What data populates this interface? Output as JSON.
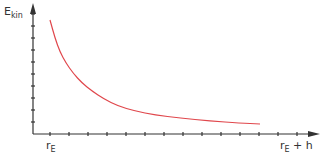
{
  "chart_data": {
    "type": "line",
    "title": "",
    "ylabel": "E_kin",
    "ylabel_main": "E",
    "ylabel_sub": "kin",
    "xlabel": "",
    "x_tick_labels": [
      {
        "main": "r",
        "sub": "E",
        "suffix": "",
        "position": "start"
      },
      {
        "main": "r",
        "sub": "E",
        "suffix": " + h",
        "position": "end"
      }
    ],
    "series": [
      {
        "name": "E_kin(r)",
        "color": "#e0474c",
        "shape": "hyperbolic decay (~1/r)",
        "points_px": [
          [
            50,
            20
          ],
          [
            55,
            38
          ],
          [
            60,
            52
          ],
          [
            66,
            63
          ],
          [
            73,
            73
          ],
          [
            82,
            83
          ],
          [
            92,
            91
          ],
          [
            104,
            99
          ],
          [
            118,
            106
          ],
          [
            135,
            111
          ],
          [
            155,
            115
          ],
          [
            180,
            118
          ],
          [
            210,
            121
          ],
          [
            240,
            123
          ],
          [
            260,
            124
          ]
        ]
      }
    ],
    "axes": {
      "color": "#333333",
      "x_ticks": 14,
      "y_ticks": 10,
      "grid": false,
      "arrows": true
    },
    "legend": null
  }
}
